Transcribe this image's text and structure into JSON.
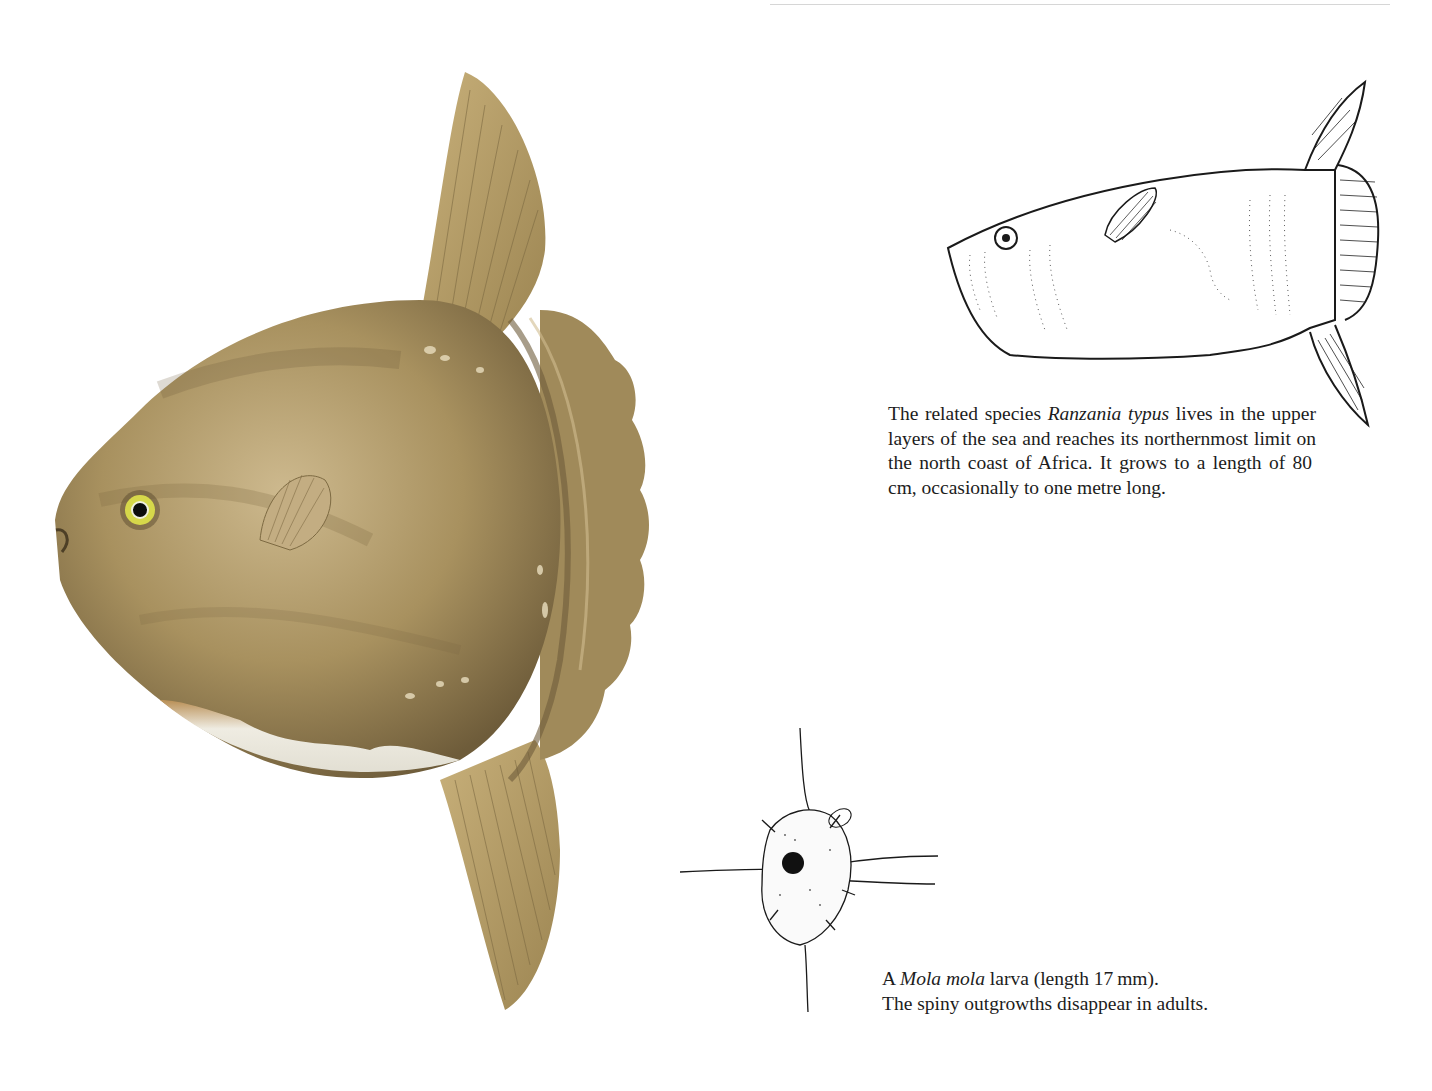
{
  "page": {
    "background": "#ffffff",
    "top_cropped_text": "",
    "colors": {
      "body_dark": "#6e5c3a",
      "body_mid": "#a38c5e",
      "body_light": "#c9b48a",
      "belly": "#e8e6dc",
      "fin": "#b8a06a",
      "eye_iris": "#d6d84a",
      "ink": "#1a1a1a"
    }
  },
  "illustrations": {
    "main": {
      "name": "Mola mola adult (ocean sunfish) colour illustration"
    },
    "ranzania": {
      "name": "Ranzania typus line drawing"
    },
    "larva": {
      "name": "Mola mola larva line drawing"
    }
  },
  "captions": {
    "ranzania": {
      "pre": "The related species ",
      "species": "Ranzania typus",
      "post": " lives in the upper layers of the sea and reaches its northernmost limit on the north coast of Africa. It grows to a length of 80 cm, occasionally to one metre long."
    },
    "larva": {
      "pre": "A ",
      "species": "Mola mola",
      "post": " larva (length 17 mm).",
      "line2": "The spiny outgrowths disappear in adults."
    }
  }
}
